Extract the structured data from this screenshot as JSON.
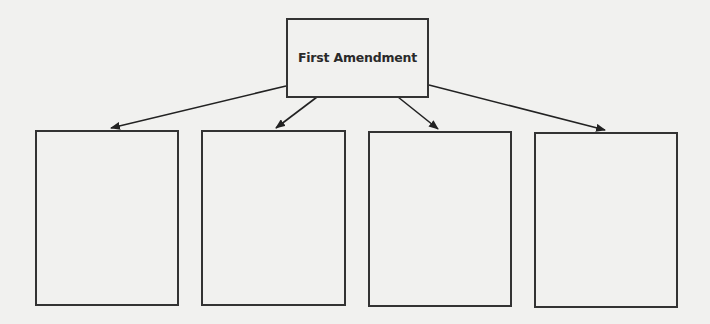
{
  "diagram": {
    "type": "concept-tree",
    "root": {
      "label": "First Amendment"
    },
    "children": [
      {
        "label": ""
      },
      {
        "label": ""
      },
      {
        "label": ""
      },
      {
        "label": ""
      }
    ],
    "colors": {
      "background": "#f1f1ef",
      "stroke": "#333333",
      "text": "#2a2a2a"
    }
  }
}
